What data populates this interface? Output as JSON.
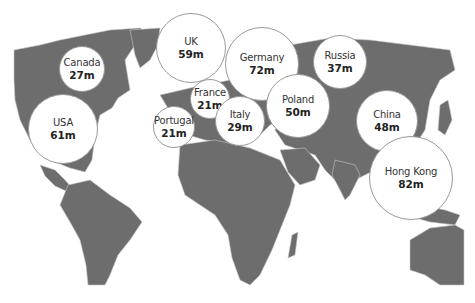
{
  "map": {
    "land_color": "#6d6d6d",
    "border_color": "#c8c8c8",
    "ocean_color": "#ffffff",
    "bubble_fill": "#ffffff",
    "bubble_stroke": "#9a9a9a"
  },
  "bubbles": [
    {
      "country": "Canada",
      "value": "27m",
      "cx": 82,
      "cy": 69,
      "r": 23
    },
    {
      "country": "UK",
      "value": "59m",
      "cx": 191,
      "cy": 48,
      "r": 35
    },
    {
      "country": "Germany",
      "value": "72m",
      "cx": 262,
      "cy": 64,
      "r": 37
    },
    {
      "country": "Russia",
      "value": "37m",
      "cx": 340,
      "cy": 62,
      "r": 27
    },
    {
      "country": "France",
      "value": "21m",
      "cx": 210,
      "cy": 99,
      "r": 20
    },
    {
      "country": "Portugal",
      "value": "21m",
      "cx": 174,
      "cy": 127,
      "r": 21
    },
    {
      "country": "Italy",
      "value": "29m",
      "cx": 240,
      "cy": 121,
      "r": 25
    },
    {
      "country": "Poland",
      "value": "50m",
      "cx": 298,
      "cy": 106,
      "r": 32
    },
    {
      "country": "USA",
      "value": "61m",
      "cx": 63,
      "cy": 129,
      "r": 35
    },
    {
      "country": "China",
      "value": "48m",
      "cx": 387,
      "cy": 121,
      "r": 31
    },
    {
      "country": "Hong Kong",
      "value": "82m",
      "cx": 411,
      "cy": 178,
      "r": 42
    }
  ]
}
